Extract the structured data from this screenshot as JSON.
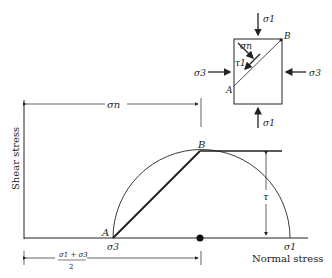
{
  "diagram": {
    "axes": {
      "y_label": "Shear stress",
      "x_label": "Normal stress"
    },
    "points": {
      "A": "A",
      "B": "B"
    },
    "labels": {
      "sigma_n": "σn",
      "sigma_3": "σ3",
      "sigma_1": "σ1",
      "tau": "τ",
      "center_numerator": "σ1 + σ3",
      "center_denominator": "2"
    },
    "element": {
      "top": "σ1",
      "bottom": "σ1",
      "left": "σ3",
      "right": "σ3",
      "normal": "σn",
      "shear": "τ1",
      "corner_A": "A",
      "corner_B": "B"
    },
    "colors": {
      "line": "#222222",
      "background": "#ffffff"
    }
  }
}
